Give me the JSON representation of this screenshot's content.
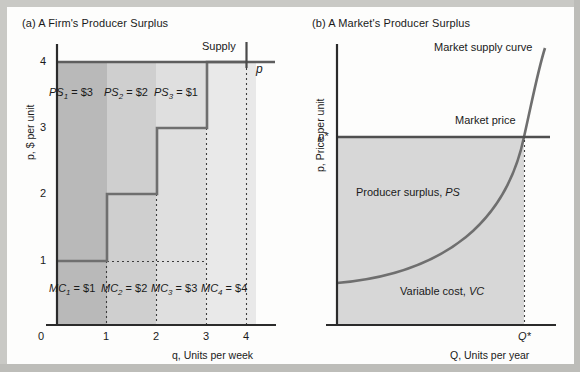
{
  "figure": {
    "background": "#fdfdfc",
    "ink": "#1a1a1a",
    "line_color": "#6b6b6b",
    "axis_color": "#2b2b2b"
  },
  "panel_a": {
    "title": "(a) A Firm's Producer Surplus",
    "y_axis_label": "p, $ per unit",
    "x_axis_label": "q, Units per week",
    "y_ticks": [
      "4",
      "3",
      "2",
      "1"
    ],
    "x_ticks": [
      "0",
      "1",
      "2",
      "3",
      "4"
    ],
    "supply_label": "Supply",
    "price_line_label": "p",
    "ps_labels": [
      {
        "name": "PS",
        "sub": "1",
        "value": "= $3"
      },
      {
        "name": "PS",
        "sub": "2",
        "value": "= $2"
      },
      {
        "name": "PS",
        "sub": "3",
        "value": "= $1"
      }
    ],
    "mc_labels": [
      {
        "name": "MC",
        "sub": "1",
        "value": "= $1"
      },
      {
        "name": "MC",
        "sub": "2",
        "value": "= $2"
      },
      {
        "name": "MC",
        "sub": "3",
        "value": "= $3"
      },
      {
        "name": "MC",
        "sub": "4",
        "value": "= $4"
      }
    ],
    "shade_colors": [
      "#b8b8b8",
      "#cdcdcd",
      "#dedede",
      "#e8e8e8"
    ],
    "chart_data": {
      "type": "bar",
      "title": "(a) A Firm's Producer Surplus",
      "xlabel": "q, Units per week",
      "ylabel": "p, $ per unit",
      "xlim": [
        0,
        4.6
      ],
      "ylim": [
        0,
        4.4
      ],
      "grid": false,
      "categories": [
        "1",
        "2",
        "3",
        "4"
      ],
      "series": [
        {
          "name": "Marginal cost (supply step)",
          "values": [
            1,
            2,
            3,
            4
          ]
        },
        {
          "name": "Producer surplus per unit",
          "values": [
            3,
            2,
            1,
            0
          ]
        }
      ],
      "market_price": 4,
      "annotations": [
        "PS1 = $3",
        "PS2 = $2",
        "PS3 = $1",
        "MC1 = $1",
        "MC2 = $2",
        "MC3 = $3",
        "MC4 = $4",
        "Supply",
        "p"
      ]
    }
  },
  "panel_b": {
    "title": "(b) A Market's Producer Surplus",
    "y_axis_label": "p, Price per unit",
    "x_axis_label": "Q, Units per year",
    "y_tick_star": "p*",
    "x_tick_star": "Q*",
    "supply_curve_label": "Market supply curve",
    "market_price_label": "Market price",
    "ps_region_label": "Producer surplus, PS",
    "vc_region_label": "Variable cost, VC",
    "shade_color": "#d6d6d6",
    "chart_data": {
      "type": "line",
      "title": "(b) A Market's Producer Surplus",
      "xlabel": "Q, Units per year",
      "ylabel": "p, Price per unit",
      "x_ticks": [
        "Q*"
      ],
      "y_ticks": [
        "p*"
      ],
      "grid": false,
      "series": [
        {
          "name": "Market supply curve",
          "x": [
            0,
            0.18,
            0.36,
            0.54,
            0.72,
            0.86,
            1.0
          ],
          "y": [
            0.15,
            0.18,
            0.24,
            0.35,
            0.52,
            0.72,
            1.18
          ]
        },
        {
          "name": "Market price",
          "x": [
            0,
            1.12
          ],
          "y": [
            0.66,
            0.66
          ]
        }
      ],
      "equilibrium": {
        "x": "Q*",
        "y": "p*"
      },
      "regions": [
        {
          "label": "Producer surplus, PS",
          "between": "market price and supply curve"
        },
        {
          "label": "Variable cost, VC",
          "between": "supply curve and quantity axis"
        }
      ]
    }
  }
}
